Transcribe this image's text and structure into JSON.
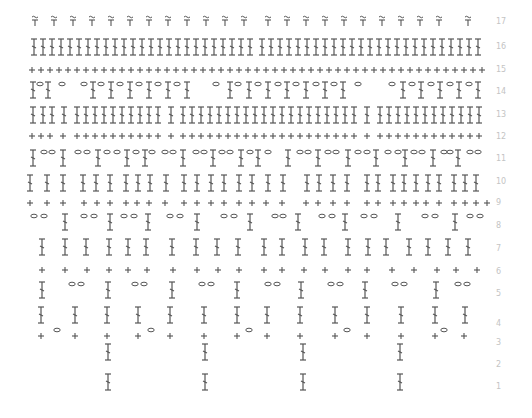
{
  "colors": {
    "stroke": "#555555",
    "label": "#c4c4c4",
    "background": "#ffffff"
  },
  "legend_symbols": {
    "dc": "double-crochet (T with slash)",
    "sc": "single-crochet (+)",
    "ch": "chain (oval)",
    "picot": "tilde-T (hdc/puff)",
    "hdc": "plain T"
  },
  "rows": [
    {
      "n": "17",
      "y": 22,
      "items": [
        {
          "t": "picot",
          "x": [
            35,
            54,
            73,
            92,
            111,
            130,
            149,
            168,
            187,
            206,
            225,
            244,
            268,
            287,
            306,
            325,
            344,
            363,
            382,
            401,
            420,
            439,
            468
          ]
        }
      ]
    },
    {
      "n": "16",
      "y": 47,
      "items": [
        {
          "t": "dc",
          "x": [
            34,
            43,
            52,
            61,
            70,
            79,
            88,
            97,
            106,
            115,
            124,
            133,
            142,
            151,
            160,
            169,
            178,
            187,
            196,
            205,
            214,
            223,
            232,
            241,
            250,
            262,
            271,
            280,
            289,
            298,
            307,
            316,
            325,
            334,
            343,
            352,
            361,
            370,
            379,
            388,
            397,
            406,
            415,
            424,
            433,
            442,
            451,
            460,
            469,
            478
          ]
        }
      ]
    },
    {
      "n": "15",
      "y": 70,
      "items": [
        {
          "t": "sc",
          "x": [
            32,
            41,
            50,
            59,
            68,
            77,
            86,
            95,
            104,
            113,
            122,
            131,
            140,
            149,
            158,
            167,
            176,
            185,
            194,
            203,
            212,
            221,
            230,
            239,
            248,
            257,
            266,
            275,
            284,
            293,
            302,
            311,
            320,
            329,
            338,
            347,
            356,
            365,
            374,
            383,
            392,
            401,
            410,
            419,
            428,
            437,
            446,
            455,
            464,
            473,
            482
          ]
        }
      ]
    },
    {
      "n": "14",
      "y": 90,
      "items": [
        {
          "t": "dc",
          "x": [
            33,
            48,
            93,
            111,
            130,
            149,
            168,
            187,
            230,
            249,
            268,
            287,
            306,
            325,
            343,
            403,
            421,
            440,
            459,
            478
          ]
        },
        {
          "t": "ch",
          "x": [
            40,
            62,
            84,
            101,
            120,
            139,
            158,
            177,
            216,
            238,
            258,
            278,
            296,
            316,
            334,
            358,
            392,
            412,
            431,
            450,
            469
          ]
        }
      ]
    },
    {
      "n": "13",
      "y": 115,
      "items": [
        {
          "t": "dc",
          "x": [
            33,
            43,
            52,
            64,
            77,
            86,
            95,
            104,
            113,
            122,
            131,
            140,
            149,
            158,
            171,
            183,
            192,
            201,
            210,
            219,
            228,
            237,
            246,
            255,
            264,
            273,
            282,
            291,
            300,
            309,
            318,
            327,
            336,
            345,
            354,
            367,
            380,
            389,
            398,
            407,
            416,
            425,
            434,
            443,
            452,
            461,
            470,
            479
          ]
        }
      ]
    },
    {
      "n": "12",
      "y": 136,
      "items": [
        {
          "t": "sc",
          "x": [
            32,
            41,
            50,
            63,
            77,
            86,
            95,
            104,
            113,
            122,
            131,
            140,
            149,
            158,
            171,
            183,
            192,
            201,
            210,
            219,
            228,
            237,
            246,
            255,
            264,
            273,
            282,
            291,
            300,
            309,
            318,
            327,
            336,
            345,
            354,
            367,
            380,
            389,
            398,
            407,
            416,
            425,
            434,
            443,
            452,
            461,
            470,
            479
          ]
        }
      ]
    },
    {
      "n": "11",
      "y": 158,
      "items": [
        {
          "t": "dc",
          "x": [
            33,
            63,
            98,
            127,
            145,
            183,
            213,
            241,
            258,
            288,
            318,
            348,
            376,
            405,
            433,
            458
          ]
        },
        {
          "t": "ch",
          "x": [
            44,
            52,
            78,
            87,
            107,
            117,
            136,
            152,
            165,
            173,
            196,
            204,
            222,
            230,
            250,
            268,
            300,
            308,
            328,
            336,
            358,
            367,
            388,
            398,
            414,
            422,
            444,
            450,
            470,
            478
          ]
        }
      ]
    },
    {
      "n": "10",
      "y": 183,
      "items": [
        {
          "t": "dc",
          "x": [
            30,
            47,
            63,
            83,
            96,
            110,
            126,
            138,
            150,
            166,
            184,
            197,
            211,
            224,
            239,
            252,
            268,
            283,
            307,
            319,
            333,
            347,
            367,
            378,
            393,
            404,
            416,
            428,
            439,
            454,
            465,
            476
          ]
        }
      ]
    },
    {
      "n": "9",
      "y": 203,
      "items": [
        {
          "t": "sc",
          "x": [
            30,
            47,
            63,
            84,
            97,
            110,
            126,
            137,
            149,
            165,
            184,
            197,
            211,
            224,
            239,
            252,
            266,
            282,
            306,
            318,
            333,
            347,
            367,
            378,
            393,
            404,
            416,
            426,
            439,
            454,
            465,
            476,
            487
          ]
        }
      ]
    },
    {
      "n": "8",
      "y": 222,
      "items": [
        {
          "t": "dc",
          "x": [
            65,
            110,
            148,
            197,
            250,
            298,
            345,
            398,
            455
          ]
        },
        {
          "t": "ch",
          "x": [
            34,
            44,
            84,
            94,
            124,
            134,
            170,
            180,
            224,
            234,
            275,
            283,
            322,
            332,
            364,
            374,
            425,
            435,
            470,
            480
          ]
        }
      ]
    },
    {
      "n": "7",
      "y": 247,
      "items": [
        {
          "t": "dc",
          "x": [
            42,
            65,
            86,
            109,
            128,
            146,
            172,
            196,
            217,
            238,
            264,
            282,
            305,
            324,
            348,
            368,
            386,
            409,
            428,
            448,
            468
          ]
        }
      ]
    },
    {
      "n": "6",
      "y": 270,
      "items": [
        {
          "t": "sc",
          "x": [
            42,
            65,
            87,
            109,
            128,
            147,
            173,
            197,
            218,
            239,
            264,
            282,
            304,
            325,
            348,
            367,
            392,
            414,
            437,
            456,
            477
          ]
        }
      ]
    },
    {
      "n": "5",
      "y": 290,
      "items": [
        {
          "t": "dc",
          "x": [
            42,
            108,
            172,
            237,
            301,
            365,
            436
          ]
        },
        {
          "t": "ch",
          "x": [
            72,
            81,
            135,
            144,
            202,
            211,
            268,
            277,
            331,
            340,
            395,
            404,
            458,
            467
          ]
        }
      ]
    },
    {
      "n": "4",
      "y": 315,
      "items": [
        {
          "t": "dc",
          "x": [
            41,
            75,
            107,
            138,
            170,
            204,
            237,
            267,
            300,
            335,
            367,
            401,
            435,
            465
          ]
        }
      ]
    },
    {
      "n": "3",
      "y": 336,
      "items": [
        {
          "t": "sc",
          "x": [
            41,
            75,
            107,
            138,
            170,
            204,
            237,
            267,
            300,
            335,
            367,
            401,
            435,
            464
          ]
        },
        {
          "t": "ch",
          "x": [
            57,
            151,
            249,
            347,
            444
          ]
        }
      ]
    },
    {
      "n": "2",
      "y": 352,
      "items": [
        {
          "t": "dc",
          "x": [
            108,
            205,
            303,
            400
          ]
        }
      ]
    },
    {
      "n": "1",
      "y": 382,
      "items": [
        {
          "t": "dc",
          "x": [
            108,
            205,
            303,
            400
          ]
        }
      ]
    }
  ],
  "row_labels": [
    "17",
    "16",
    "15",
    "14",
    "13",
    "12",
    "11",
    "10",
    "9",
    "8",
    "7",
    "6",
    "5",
    "4",
    "3",
    "2",
    "1"
  ],
  "row_label_y": [
    22,
    47,
    70,
    92,
    115,
    137,
    159,
    182,
    203,
    226,
    249,
    272,
    294,
    324,
    343,
    365,
    387
  ]
}
